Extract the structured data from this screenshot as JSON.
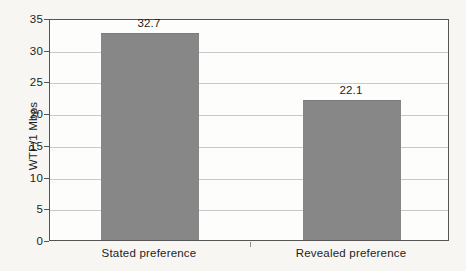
{
  "chart_data": {
    "type": "bar",
    "title": "",
    "subtitle": "",
    "xlabel": "",
    "ylabel": "WTP/1 Mbps",
    "categories": [
      "Stated preference",
      "Revealed preference"
    ],
    "values": [
      32.7,
      22.1
    ],
    "value_labels": [
      "32.7",
      "22.1"
    ],
    "ylim": [
      0,
      35
    ],
    "ytick_labels": [
      "0",
      "5",
      "10",
      "15",
      "20",
      "25",
      "30",
      "35"
    ],
    "ytick_values": [
      0,
      5,
      10,
      15,
      20,
      25,
      30,
      35
    ],
    "grid": "horizontal",
    "legend": "none",
    "bar_color": "#878787",
    "gridline_color": "#c9c9c9",
    "axis_color": "#555555",
    "text_color": "#1d1d1d",
    "background_color": "#f7f6f3",
    "plot_background_color": "#fdfdfc"
  }
}
